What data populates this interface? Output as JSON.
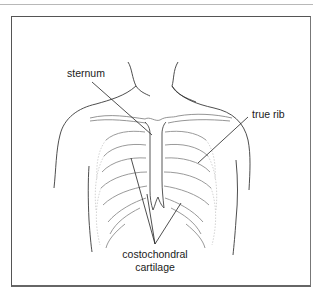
{
  "figure": {
    "labels": {
      "sternum": "sternum",
      "true_rib": "true rib",
      "costochondral_line1": "costochondral",
      "costochondral_line2": "cartilage"
    },
    "colors": {
      "outline": "#3a3a3a",
      "rib": "#9a9a9a",
      "leader": "#222222",
      "frame": "#555555"
    }
  }
}
